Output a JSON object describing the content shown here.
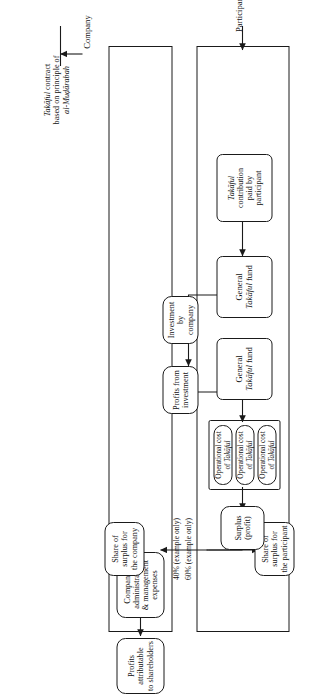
{
  "figure": {
    "orientation": "rotated-90-ccw",
    "actors": {
      "company": "Company",
      "participant": "Participant"
    },
    "contract_label": {
      "line1_italic": "Takāful",
      "line1_rest": " contract",
      "line2": "based on principle of",
      "line3_italic": "al-Muḍārabah"
    },
    "nodes": {
      "profits_shareholders": "Profits attributable\nto shareholders",
      "admin_expenses": "Company’s administration\n& management expenses",
      "share_company": "Share of surplus for\nthe company",
      "share_participant": "Share of surplus for\nthe participant",
      "surplus": "Surplus\n(profit)",
      "operational_cost_italic": "Takāful",
      "operational_cost_1": "Operational cost",
      "operational_cost_2": "of ",
      "profits_investment": "Profits from\ninvestment",
      "investment_by_company": "Investment by\ncompany",
      "general_fund_upper": "General",
      "general_fund_upper_italic": "Takāful",
      "general_fund_upper_tail": " fund",
      "general_fund_lower": "General",
      "general_fund_lower_italic": "Takāful",
      "general_fund_lower_tail": " fund",
      "contribution_italic": "Takāful",
      "contribution_rest": "contribution\npaid by\nparticipant"
    },
    "split_labels": {
      "company_share": "40% (example only)",
      "participant_share": "60% (example only)"
    },
    "operational_costs": [
      {
        "line1": "Operational cost",
        "line2_prefix": "of ",
        "line2_italic": "Takāful"
      },
      {
        "line1": "Operational cost",
        "line2_prefix": "of ",
        "line2_italic": "Takāful"
      },
      {
        "line1": "Operational cost",
        "line2_prefix": "of ",
        "line2_italic": "Takāful"
      }
    ],
    "colors": {
      "stroke": "#1a1a1a",
      "background": "#ffffff",
      "text": "#111111"
    }
  }
}
